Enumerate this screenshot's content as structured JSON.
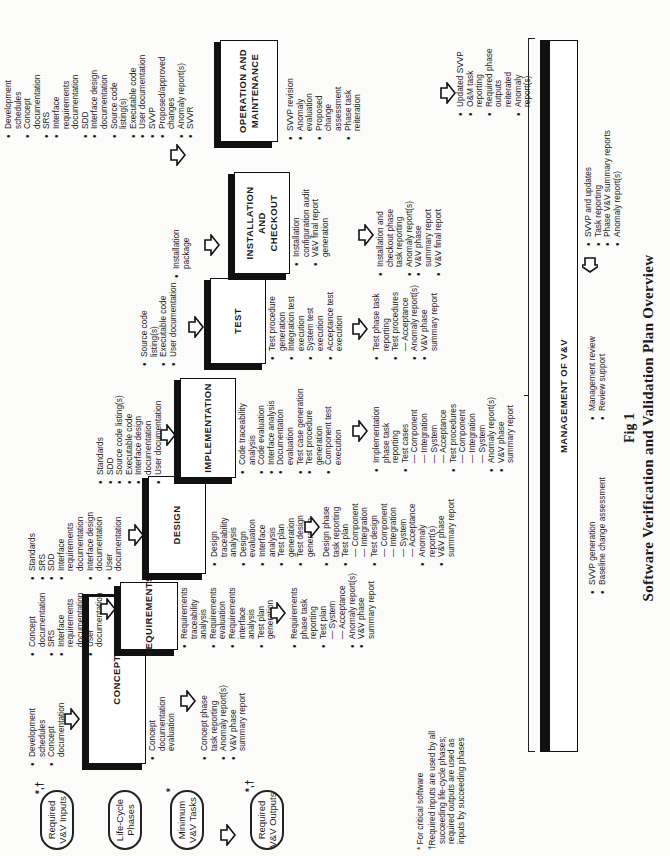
{
  "legend_ovals": {
    "inputs": {
      "label_line1": "Required",
      "label_line2": "V&V Inputs",
      "mark": "*,†"
    },
    "phases": {
      "label_line1": "Life-Cycle",
      "label_line2": "Phases"
    },
    "tasks": {
      "label_line1": "Minimum",
      "label_line2": "V&V Tasks",
      "mark": "*"
    },
    "outputs": {
      "label_line1": "Required",
      "label_line2": "V&V Outputs",
      "mark": "*,†"
    }
  },
  "phases": [
    {
      "name": "CONCEPT",
      "inputs": [
        "Development schedules",
        "Concept documentation"
      ],
      "tasks": [
        "Concept documentation evaluation"
      ],
      "outputs": [
        "Concept phase task reporting",
        "Anomaly report(s)",
        "V&V phase summary report"
      ]
    },
    {
      "name": "REQUIREMENTS",
      "inputs": [
        "Concept documentation",
        "SRS",
        "Interface requirements documentation",
        "User documentation"
      ],
      "tasks": [
        "Requirements traceability analysis",
        "Requirements evaluation",
        "Requirements interface analysis",
        "Test plan generation"
      ],
      "outputs": [
        "Requirements phase task reporting",
        "Test plan",
        "— System",
        "— Acceptance",
        "Anomaly report(s)",
        "V&V phase summary report"
      ]
    },
    {
      "name": "DESIGN",
      "inputs": [
        "Standards",
        "SRS",
        "SDD",
        "Interface requirements documentation",
        "Interface design documentation",
        "User documentation"
      ],
      "tasks": [
        "Design traceability analysis",
        "Design evaluation",
        "Interface analysis",
        "Test plan generation",
        "Test design generation"
      ],
      "outputs": [
        "Design phase task reporting",
        "Test plan",
        "— Component",
        "— Integration",
        "Test design",
        "— Component",
        "— Integration",
        "— System",
        "— Acceptance",
        "Anomaly report(s)",
        "V&V phase summary report"
      ]
    },
    {
      "name": "IMPLEMENTATION",
      "inputs": [
        "Standards",
        "SDD",
        "Source code listing(s)",
        "Executable code",
        "Interface design documentation",
        "User documentation"
      ],
      "tasks": [
        "Code traceability analysis",
        "Code evaluation",
        "Interface analysis",
        "Documentation evaluation",
        "Test case generation",
        "Test procedure generation",
        "Component test execution"
      ],
      "outputs": [
        "Implementation phase task reporting",
        "Test cases",
        "— Component",
        "— Integration",
        "— System",
        "— Acceptance",
        "Test procedures",
        "— Component",
        "— Integration",
        "— System",
        "Anomaly report(s)",
        "V&V phase summary report"
      ]
    },
    {
      "name": "TEST",
      "inputs": [
        "Source code listing(s)",
        "Executable code",
        "User documentation"
      ],
      "tasks": [
        "Test procedure generation",
        "Integration test execution",
        "System test execution",
        "Acceptance test execution"
      ],
      "outputs": [
        "Test phase task reporting",
        "Test procedures",
        "— Acceptance",
        "Anomaly report(s)",
        "V&V phase summary report"
      ]
    },
    {
      "name": "INSTALLATION AND CHECKOUT",
      "inputs": [
        "Installation package"
      ],
      "tasks": [
        "Installation configuration audit",
        "V&V final report generation"
      ],
      "outputs": [
        "Installation and checkout phase task reporting",
        "Anomaly report(s)",
        "V&V phase summary report",
        "V&V final report"
      ]
    },
    {
      "name": "OPERATION AND MAINTENANCE",
      "inputs": [
        "Development schedules",
        "Concept documentation",
        "SRS",
        "Interface requirements documentation",
        "SDD",
        "Interface design documentation",
        "Source code listing(s)",
        "Executable code",
        "User documentation",
        "SVVP",
        "Proposed/approved changes",
        "Anomaly report(s)",
        "SVVR"
      ],
      "tasks": [
        "SVVP revision",
        "Anomaly evaluation",
        "Proposed change assessment",
        "Phase task reiteration"
      ],
      "outputs": [
        "Updated SVVP",
        "O&M task reporting",
        "Required phase outputs reiterated",
        "Anomaly report(s)"
      ]
    }
  ],
  "management": {
    "title": "MANAGEMENT OF V&V",
    "tasks_col1": [
      "SVVP generation",
      "Baseline change assessment"
    ],
    "tasks_col2": [
      "Management review",
      "Review support"
    ],
    "outputs": [
      "SVVP and updates",
      "Task reporting",
      "Phase V&V summary reports",
      "Anomaly report(s)"
    ]
  },
  "footnotes": {
    "star": "* For critical software",
    "dagger_l1": "†Required inputs are used by all",
    "dagger_l2": "succeeding life-cycle phases;",
    "dagger_l3": "required outputs are used as",
    "dagger_l4": "inputs by succeeding phases"
  },
  "caption": {
    "figure": "Fig 1",
    "title": "Software Verification and Validation Plan Overview"
  },
  "icons": {
    "flow_arrow": "block-arrow-down",
    "mgmt_arrow": "block-arrow-up"
  }
}
